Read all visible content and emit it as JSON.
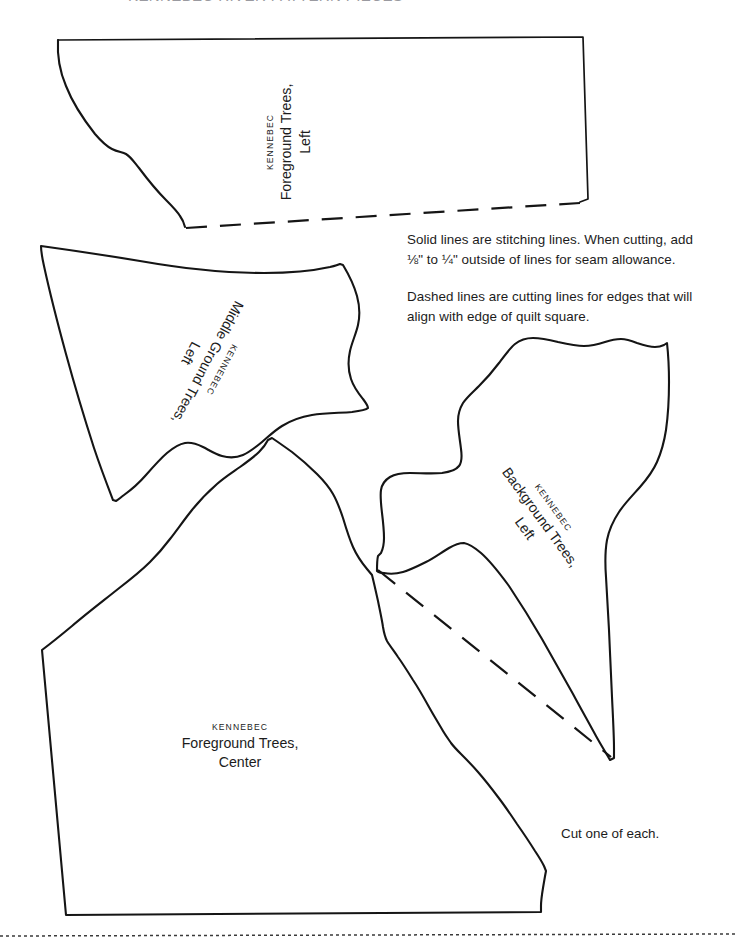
{
  "page": {
    "header_cropped_text": "KENNEBEC RIVER PATTERN PIECES",
    "background_color": "#ffffff",
    "ink_color": "#1c1c1c"
  },
  "instructions": {
    "paragraph_1": "Solid lines are stitching lines. When cutting, add ⅛\" to ¼\" outside of lines for seam allowance.",
    "paragraph_2": "Dashed lines are cutting lines for edges that will align with edge of quilt square.",
    "cut_note": "Cut one of each."
  },
  "pieces": [
    {
      "id": "foreground-trees-left",
      "brand": "KENNEBEC",
      "name": "Foreground Trees,",
      "sub": "Left"
    },
    {
      "id": "middle-ground-trees-left",
      "brand": "KENNEBEC",
      "name": "Middle Ground Trees,",
      "sub": "Left"
    },
    {
      "id": "background-trees-left",
      "brand": "KENNEBEC",
      "name": "Background Trees,",
      "sub": "Left"
    },
    {
      "id": "foreground-trees-center",
      "brand": "KENNEBEC",
      "name": "Foreground Trees,",
      "sub": "Center"
    }
  ],
  "line_styles": {
    "solid_label": "stitching line",
    "dashed_label": "cutting line",
    "page_edge_label": "page trim line"
  }
}
